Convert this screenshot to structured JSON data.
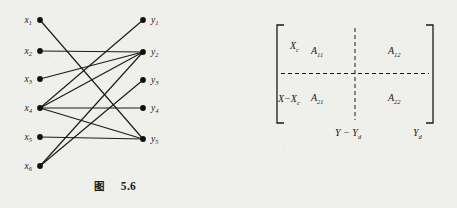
{
  "figures": [
    {
      "id": "figure-5-6",
      "type": "bipartite-graph",
      "caption_cn": "图",
      "caption_num": "5.6",
      "left_nodes": [
        {
          "id": "x1",
          "label": "x",
          "sub": "1",
          "x": 40,
          "y": 20
        },
        {
          "id": "x2",
          "label": "x",
          "sub": "2",
          "x": 40,
          "y": 51
        },
        {
          "id": "x3",
          "label": "x",
          "sub": "3",
          "x": 40,
          "y": 79
        },
        {
          "id": "x4",
          "label": "x",
          "sub": "4",
          "x": 40,
          "y": 108
        },
        {
          "id": "x5",
          "label": "x",
          "sub": "5",
          "x": 40,
          "y": 137
        },
        {
          "id": "x6",
          "label": "x",
          "sub": "6",
          "x": 40,
          "y": 166
        }
      ],
      "right_nodes": [
        {
          "id": "y1",
          "label": "y",
          "sub": "1",
          "x": 143,
          "y": 20
        },
        {
          "id": "y2",
          "label": "y",
          "sub": "2",
          "x": 143,
          "y": 52
        },
        {
          "id": "y3",
          "label": "y",
          "sub": "3",
          "x": 143,
          "y": 80
        },
        {
          "id": "y4",
          "label": "y",
          "sub": "4",
          "x": 143,
          "y": 108
        },
        {
          "id": "y5",
          "label": "y",
          "sub": "5",
          "x": 143,
          "y": 139
        }
      ],
      "edges": [
        {
          "from": "x1",
          "to": "y5"
        },
        {
          "from": "x2",
          "to": "y2"
        },
        {
          "from": "x3",
          "to": "y2"
        },
        {
          "from": "x4",
          "to": "y1"
        },
        {
          "from": "x4",
          "to": "y2"
        },
        {
          "from": "x4",
          "to": "y4"
        },
        {
          "from": "x4",
          "to": "y5"
        },
        {
          "from": "x5",
          "to": "y5"
        },
        {
          "from": "x6",
          "to": "y2"
        },
        {
          "from": "x6",
          "to": "y3"
        }
      ],
      "node_color": "#111111",
      "edge_color": "#1a1a1a"
    },
    {
      "id": "figure-5-7",
      "type": "block-matrix",
      "caption_cn": "图",
      "caption_num": "5.7",
      "row_labels": [
        "X",
        "X−X"
      ],
      "row_label_subs": [
        "c",
        "c"
      ],
      "col_labels": [
        "Y − Y",
        "Y"
      ],
      "col_label_subs": [
        "d",
        "d"
      ],
      "cells": [
        [
          {
            "base": "A",
            "sub": "11"
          },
          {
            "base": "A",
            "sub": "12"
          }
        ],
        [
          {
            "base": "A",
            "sub": "21"
          },
          {
            "base": "A",
            "sub": "22"
          }
        ]
      ],
      "bracket_color": "#1a1a1a",
      "divider_style": "dashed"
    }
  ]
}
